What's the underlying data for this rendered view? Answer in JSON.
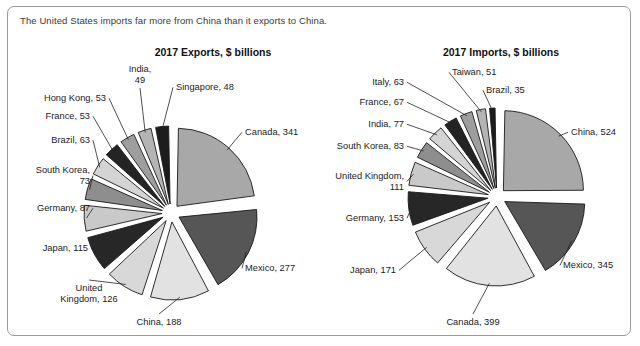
{
  "caption": "The United States imports far more from China than it exports to China.",
  "charts": [
    {
      "id": "exports",
      "title": "2017 Exports, $ billions",
      "chart_data": {
        "type": "pie",
        "title": "2017 Exports, $ billions",
        "unit": "$ billions",
        "year": "2017",
        "categories": [
          "Canada",
          "Mexico",
          "China",
          "United Kingdom",
          "Japan",
          "Germany",
          "South Korea",
          "Brazil",
          "France",
          "Hong Kong",
          "India",
          "Singapore"
        ],
        "values": [
          341,
          277,
          188,
          126,
          115,
          87,
          73,
          63,
          53,
          53,
          49,
          48
        ],
        "labels": [
          "Canada, 341",
          "Mexico, 277",
          "China, 188",
          "United\nKingdom, 126",
          "Japan, 115",
          "Germany, 87",
          "South Korea,\n73",
          "Brazil, 63",
          "France, 53",
          "Hong Kong, 53",
          "India,\n49",
          "Singapore, 48"
        ],
        "colors": [
          "#a8a8a8",
          "#565656",
          "#e2e2e2",
          "#d8d8d8",
          "#272727",
          "#c9c9c9",
          "#8e8e8e",
          "#d4d4d4",
          "#242424",
          "#9e9e9e",
          "#b4b4b4",
          "#1c1c1c"
        ],
        "legend": "none",
        "grid": false
      }
    },
    {
      "id": "imports",
      "title": "2017 Imports, $ billions",
      "chart_data": {
        "type": "pie",
        "title": "2017 Imports, $ billions",
        "unit": "$ billions",
        "year": "2017",
        "categories": [
          "China",
          "Mexico",
          "Canada",
          "Japan",
          "Germany",
          "United Kingdom",
          "South Korea",
          "India",
          "France",
          "Italy",
          "Taiwan",
          "Brazil"
        ],
        "values": [
          524,
          345,
          399,
          171,
          153,
          111,
          83,
          77,
          67,
          63,
          51,
          35
        ],
        "labels": [
          "China, 524",
          "Mexico, 345",
          "Canada, 399",
          "Japan, 171",
          "Germany, 153",
          "United Kingdom,\n111",
          "South Korea, 83",
          "India, 77",
          "France, 67",
          "Italy, 63",
          "Taiwan, 51",
          "Brazil, 35"
        ],
        "colors": [
          "#a8a8a8",
          "#565656",
          "#e2e2e2",
          "#d8d8d8",
          "#272727",
          "#c9c9c9",
          "#8e8e8e",
          "#d4d4d4",
          "#242424",
          "#9e9e9e",
          "#b4b4b4",
          "#1c1c1c"
        ],
        "legend": "none",
        "grid": false
      }
    }
  ],
  "colors": {
    "border": "#9a9a9a",
    "text": "#1b1b1b",
    "caption_text": "#3a3a3a",
    "slice_outline": "#1a1a1a",
    "background": "#ffffff"
  }
}
